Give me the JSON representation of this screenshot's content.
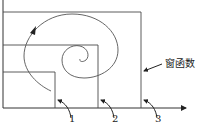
{
  "diagram": {
    "title": "",
    "colors": {
      "line": "#4a4a4a",
      "axis": "#333333",
      "text": "#222222",
      "background": "#ffffff"
    },
    "window_label": "窗函数",
    "windows": [
      {
        "id": "1",
        "label": "1"
      },
      {
        "id": "2",
        "label": "2"
      },
      {
        "id": "3",
        "label": "3"
      }
    ],
    "elements": {
      "axes": "horizontal axis with arrow, vertical axis",
      "spiral": "spiral curve with arrowhead",
      "nested_windows": 3
    }
  }
}
